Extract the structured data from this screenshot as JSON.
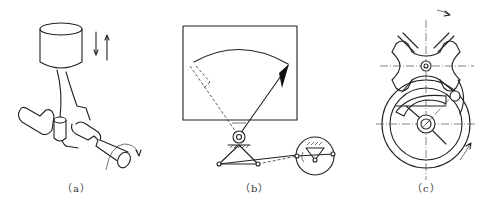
{
  "figure": {
    "panels": [
      {
        "id": "a",
        "caption": "（a）",
        "subject": "piston-crank mechanism"
      },
      {
        "id": "b",
        "caption": "（b）",
        "subject": "linkage pointer indicator"
      },
      {
        "id": "c",
        "caption": "（c）",
        "subject": "Geneva (sheave) mechanism"
      }
    ]
  }
}
